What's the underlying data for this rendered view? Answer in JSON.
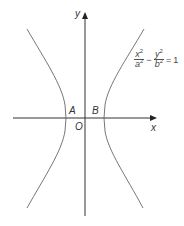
{
  "diagram": {
    "type": "hyperbola",
    "equation": {
      "term1_num_var": "x",
      "term1_num_exp": "2",
      "term1_den_var": "a",
      "term1_den_exp": "2",
      "operator": "−",
      "term2_num_var": "y",
      "term2_num_exp": "2",
      "term2_den_var": "b",
      "term2_den_exp": "2",
      "equals": "=",
      "rhs": "1"
    },
    "axes": {
      "x_label": "x",
      "y_label": "y",
      "origin_label": "O"
    },
    "points": {
      "left_vertex": "A",
      "right_vertex": "B"
    },
    "colors": {
      "axis": "#333333",
      "curve": "#555555",
      "text": "#333333"
    }
  }
}
